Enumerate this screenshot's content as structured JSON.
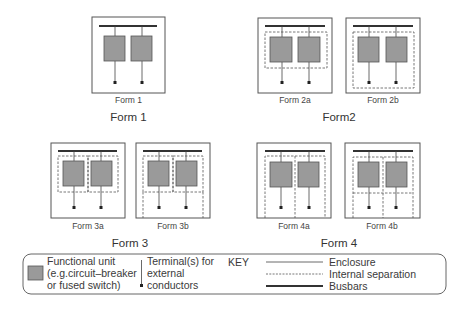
{
  "colors": {
    "enclosure": "#555555",
    "separation": "#555555",
    "busbar": "#333333",
    "unit_fill": "#9a9a9a",
    "unit_stroke": "#555555",
    "text": "#333333"
  },
  "groups": [
    {
      "label": "Form 1",
      "diagrams": [
        {
          "caption": "Form 1",
          "variant": "1"
        }
      ]
    },
    {
      "label": "Form2",
      "diagrams": [
        {
          "caption": "Form 2a",
          "variant": "2a"
        },
        {
          "caption": "Form 2b",
          "variant": "2b"
        }
      ]
    },
    {
      "label": "Form 3",
      "diagrams": [
        {
          "caption": "Form 3a",
          "variant": "3a"
        },
        {
          "caption": "Form 3b",
          "variant": "3b"
        }
      ]
    },
    {
      "label": "Form 4",
      "diagrams": [
        {
          "caption": "Form 4a",
          "variant": "4a"
        },
        {
          "caption": "Form 4b",
          "variant": "4b"
        }
      ]
    }
  ],
  "key": {
    "title": "KEY",
    "functional_unit": [
      "Functional unit",
      "(e.g.circuit–breaker",
      "or fused switch)"
    ],
    "terminal": [
      "Terminal(s) for",
      "external",
      "conductors"
    ],
    "line_types": [
      {
        "label": "Enclosure",
        "style": "solid-thin"
      },
      {
        "label": "Internal separation",
        "style": "dashed"
      },
      {
        "label": "Busbars",
        "style": "solid-thick"
      }
    ]
  }
}
